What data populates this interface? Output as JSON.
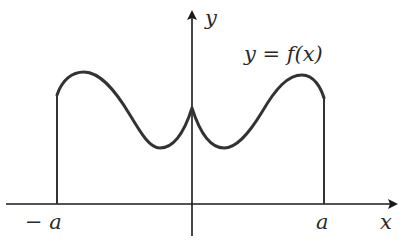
{
  "diagram": {
    "x_axis_label": "x",
    "y_axis_label": "y",
    "curve_label": "y = f(x)",
    "left_bound_label": "− a",
    "right_bound_label": "a",
    "colors": {
      "axes": "#1a1a1a",
      "curve": "#333333",
      "text": "#2a2a2a",
      "background": "#ffffff"
    }
  }
}
